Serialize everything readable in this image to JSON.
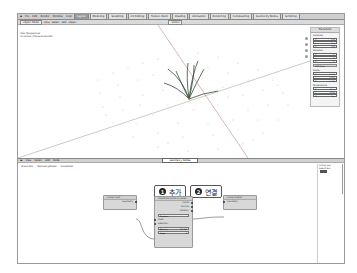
{
  "topbar": {
    "menu": [
      "File",
      "Edit",
      "Render",
      "Window",
      "Help"
    ],
    "workspaces": [
      {
        "label": "Layout",
        "active": true
      },
      {
        "label": "Modeling"
      },
      {
        "label": "Sculpting"
      },
      {
        "label": "UV Editing"
      },
      {
        "label": "Texture Paint"
      },
      {
        "label": "Shading"
      },
      {
        "label": "Animation"
      },
      {
        "label": "Rendering"
      },
      {
        "label": "Compositing"
      },
      {
        "label": "Geometry Nodes"
      },
      {
        "label": "Scripting"
      }
    ]
  },
  "viewport_header": {
    "mode": "Object Mode",
    "menu": [
      "View",
      "Select",
      "Add",
      "Object"
    ],
    "orientation": "Global",
    "info_line1": "User Perspective",
    "info_line2": "(1) Grass | Plane.Grass.001"
  },
  "npanel": {
    "title": "Transform",
    "location": {
      "label": "Location",
      "x": "0 m",
      "y": "0 m",
      "z": "0 m"
    },
    "rotation": {
      "label": "Rotation",
      "x": "0°",
      "y": "0°",
      "z": "0°",
      "mode": "XYZ Euler"
    },
    "scale": {
      "label": "Scale",
      "x": "1.000",
      "y": "1.000",
      "z": "1.000"
    },
    "dimensions": {
      "label": "Dimensions",
      "x": "10 m",
      "y": "10 m",
      "z": "0 m"
    }
  },
  "node_header": {
    "menu": [
      "View",
      "Select",
      "Add",
      "Node"
    ],
    "tree_name": "Geometry Nodes"
  },
  "breadcrumbs": [
    "Grass.001",
    "GeometryNodes",
    "GrassField"
  ],
  "callouts": [
    {
      "num": "1",
      "label": "추가"
    },
    {
      "num": "2",
      "label": "연결"
    }
  ],
  "nodes": {
    "group_input": {
      "title": "Group Input",
      "outputs": [
        "Geometry"
      ]
    },
    "distribute": {
      "title": "Distribute Points on Faces",
      "outputs": [
        "Points",
        "Normal",
        "Rotation"
      ],
      "mode": "Random",
      "inputs": [
        "Mesh",
        "Selection"
      ],
      "density_label": "Density",
      "density_value": "10.000",
      "seed_label": "Seed",
      "seed_value": "0"
    },
    "group_output": {
      "title": "Group Output",
      "inputs": [
        "Geometry"
      ]
    }
  },
  "sidebar": {
    "title": "Active Tool",
    "item": "Select Box"
  }
}
